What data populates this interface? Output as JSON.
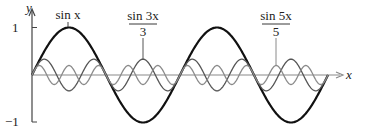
{
  "chart_data": {
    "type": "line",
    "title": "",
    "xlabel": "x",
    "ylabel": "y",
    "xlim": [
      0,
      12.566
    ],
    "ylim": [
      -1,
      1
    ],
    "x_range_label": "0 to 4π",
    "yticks": [
      {
        "value": 1,
        "label": "1"
      },
      {
        "value": -1,
        "label": "−1"
      }
    ],
    "grid": false,
    "legend": "inline labels with leader lines",
    "series": [
      {
        "name": "sin x",
        "formula": "sin(x)",
        "amplitude": 1,
        "frequency": 1,
        "color": "#111111",
        "stroke_width": 2.2,
        "label": {
          "text_main": "sin x",
          "fraction": false,
          "anchor_x": 1.5708,
          "anchor_value": 1
        }
      },
      {
        "name": "sin 3x / 3",
        "formula": "sin(3x)/3",
        "amplitude": 0.3333,
        "frequency": 3,
        "color": "#555555",
        "stroke_width": 1.3,
        "label": {
          "numerator": "sin 3x",
          "denominator": "3",
          "fraction": true,
          "anchor_x": 4.7124,
          "anchor_value": 0.3333
        }
      },
      {
        "name": "sin 5x / 5",
        "formula": "sin(5x)/5",
        "amplitude": 0.2,
        "frequency": 5,
        "color": "#8a8a8a",
        "stroke_width": 1.3,
        "label": {
          "numerator": "sin 5x",
          "denominator": "5",
          "fraction": true,
          "anchor_x": 10.3673,
          "anchor_value": 0.2
        }
      }
    ]
  },
  "axes": {
    "x_label": "x",
    "y_label": "y",
    "tick_top": "1",
    "tick_bottom": "−1",
    "axis_color": "#888888",
    "yaxis_color": "#444444"
  },
  "labels": {
    "sinx": "sin x",
    "sin3x_num": "sin 3x",
    "sin3x_den": "3",
    "sin5x_num": "sin 5x",
    "sin5x_den": "5"
  }
}
